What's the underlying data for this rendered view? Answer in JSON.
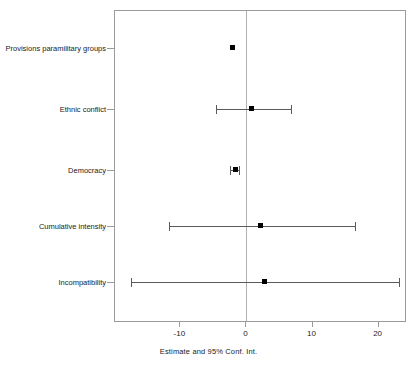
{
  "chart_data": {
    "type": "scatter",
    "subtype": "forest-plot",
    "title": "",
    "xlabel": "Estimate and 95% Conf. Int.",
    "ylabel": "",
    "xlim": [
      -19.9,
      24.3
    ],
    "xticks": [
      -10,
      0,
      10,
      20
    ],
    "xticklabels": [
      "-10",
      "0",
      "10",
      "20"
    ],
    "grid": false,
    "legend": null,
    "reference_line": 0,
    "categories": [
      "Provisions paramilitary groups",
      "Ethnic conflict",
      "Democracy",
      "Cumulative intensity",
      "Incompatibility"
    ],
    "points": [
      {
        "label": "Provisions paramilitary groups",
        "estimate": -2.2,
        "ci_low": -2.3,
        "ci_high": -2.1
      },
      {
        "label": "Ethnic conflict",
        "estimate": 0.7,
        "ci_low": -4.6,
        "ci_high": 6.7
      },
      {
        "label": "Democracy",
        "estimate": -1.8,
        "ci_low": -2.5,
        "ci_high": -1.1
      },
      {
        "label": "Cumulative intensity",
        "estimate": 2.0,
        "ci_low": -11.7,
        "ci_high": 16.4
      },
      {
        "label": "Incompatibility",
        "estimate": 2.6,
        "ci_low": -17.5,
        "ci_high": 23.1
      }
    ]
  },
  "colors": {
    "point": "#000000",
    "interval": "#5a5a5a",
    "axis": "#9a9a9a",
    "reference": "#b0b0b0",
    "text": "#222222",
    "background": "#ffffff"
  }
}
